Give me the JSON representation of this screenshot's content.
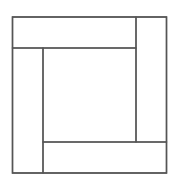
{
  "diagram": {
    "stroke_color": "#555555",
    "background": "#ffffff",
    "outer_square": {
      "x": 12.5,
      "y": 17,
      "w": 154,
      "h": 156
    },
    "shapes": [
      {
        "name": "top-rectangle",
        "x": 12.5,
        "y": 17,
        "w": 123.5,
        "h": 31
      },
      {
        "name": "right-rectangle",
        "x": 136,
        "y": 17,
        "w": 30.5,
        "h": 125
      },
      {
        "name": "bottom-rectangle",
        "x": 43,
        "y": 142,
        "w": 123.5,
        "h": 31
      },
      {
        "name": "left-rectangle",
        "x": 12.5,
        "y": 48,
        "w": 30.5,
        "h": 125
      },
      {
        "name": "center-square",
        "x": 43,
        "y": 48,
        "w": 93,
        "h": 94
      }
    ]
  }
}
